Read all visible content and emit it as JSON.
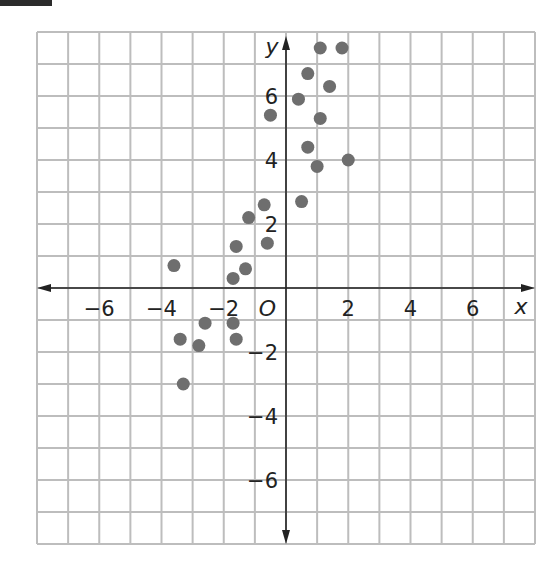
{
  "chart_data": {
    "type": "scatter",
    "title": "",
    "xlabel": "x",
    "ylabel": "y",
    "origin_label": "O",
    "xlim": [
      -8,
      8
    ],
    "ylim": [
      -8,
      8
    ],
    "grid": true,
    "grid_step": 1,
    "x_tick_labels": [
      "-6",
      "-4",
      "-2",
      "2",
      "4",
      "6"
    ],
    "y_tick_labels": [
      "6",
      "4",
      "2",
      "-2",
      "-4",
      "-6"
    ],
    "x_ticks": [
      -6,
      -4,
      -2,
      2,
      4,
      6
    ],
    "y_ticks": [
      6,
      4,
      2,
      -2,
      -4,
      -6
    ],
    "legend": null,
    "marker_color": "#6e6e6e",
    "grid_color": "#bdbdbd",
    "axis_color": "#222222",
    "points": [
      {
        "x": -3.6,
        "y": 0.7
      },
      {
        "x": -3.4,
        "y": -1.6
      },
      {
        "x": -3.3,
        "y": -3.0
      },
      {
        "x": -2.8,
        "y": -1.8
      },
      {
        "x": -2.6,
        "y": -1.1
      },
      {
        "x": -1.7,
        "y": -1.1
      },
      {
        "x": -1.6,
        "y": -1.6
      },
      {
        "x": -1.6,
        "y": 1.3
      },
      {
        "x": -1.7,
        "y": 0.3
      },
      {
        "x": -1.3,
        "y": 0.6
      },
      {
        "x": -1.2,
        "y": 2.2
      },
      {
        "x": -0.7,
        "y": 2.6
      },
      {
        "x": -0.6,
        "y": 1.4
      },
      {
        "x": -0.5,
        "y": 5.4
      },
      {
        "x": 0.4,
        "y": 5.9
      },
      {
        "x": 0.5,
        "y": 2.7
      },
      {
        "x": 0.7,
        "y": 6.7
      },
      {
        "x": 0.7,
        "y": 4.4
      },
      {
        "x": 1.0,
        "y": 3.8
      },
      {
        "x": 1.1,
        "y": 5.3
      },
      {
        "x": 1.1,
        "y": 7.5
      },
      {
        "x": 1.4,
        "y": 6.3
      },
      {
        "x": 1.8,
        "y": 7.5
      },
      {
        "x": 2.0,
        "y": 4.0
      }
    ]
  }
}
